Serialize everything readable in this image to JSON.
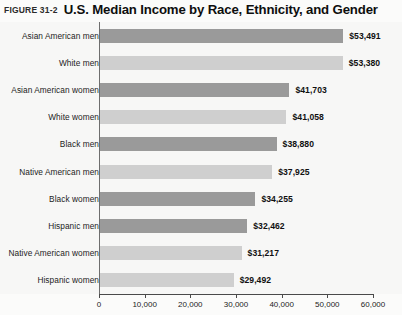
{
  "figure": {
    "number": "FIGURE 31-2",
    "title": "U.S. Median Income by Race, Ethnicity, and Gender"
  },
  "chart_data": {
    "type": "bar",
    "orientation": "horizontal",
    "title": "U.S. Median Income by Race, Ethnicity, and Gender",
    "subtitle": "",
    "xlabel": "",
    "ylabel": "",
    "xlim": [
      0,
      60000
    ],
    "grid": false,
    "legend": "none",
    "tick_labels": [
      "0",
      "10,000",
      "20,000",
      "30,000",
      "40,000",
      "50,000",
      "60,000"
    ],
    "tick_values": [
      0,
      10000,
      20000,
      30000,
      40000,
      50000,
      60000
    ],
    "categories": [
      "Asian American men",
      "White men",
      "Asian American women",
      "White women",
      "Black men",
      "Native American men",
      "Black women",
      "Hispanic men",
      "Native American women",
      "Hispanic women"
    ],
    "values": [
      53491,
      53380,
      41703,
      41058,
      38880,
      37925,
      34255,
      32462,
      31217,
      29492
    ],
    "value_labels": [
      "$53,491",
      "$53,380",
      "$41,703",
      "$41,058",
      "$38,880",
      "$37,925",
      "$34,255",
      "$32,462",
      "$31,217",
      "$29,492"
    ],
    "bar_shades": [
      "dark",
      "light",
      "dark",
      "light",
      "dark",
      "light",
      "dark",
      "dark",
      "light",
      "light"
    ],
    "colors": {
      "bar_dark": "#9a9a9a",
      "bar_light": "#cfcfcf",
      "axis": "#4a4a4a",
      "text": "#1a1a1a",
      "background": "#f7f7f6"
    }
  }
}
